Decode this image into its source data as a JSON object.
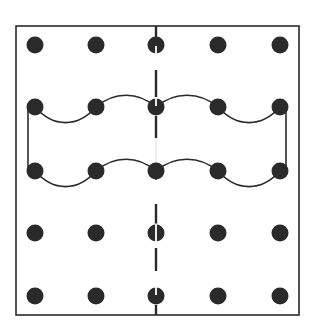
{
  "figure": {
    "width": 310,
    "height": 330,
    "background": "#ffffff",
    "ink_color": "#2a2a2a",
    "frame": {
      "x1": 16,
      "y1": 26,
      "x2": 299,
      "y2": 315,
      "stroke_width": 1.6
    },
    "grid": {
      "columns_x": [
        35,
        96,
        156,
        218,
        280
      ],
      "rows_y": [
        45,
        107,
        171,
        233,
        296
      ],
      "dot_radius": 8.5
    },
    "axis_of_symmetry": {
      "x": 156,
      "dashes": [
        [
          26,
          38
        ],
        [
          70,
          97
        ],
        [
          116,
          138
        ],
        [
          204,
          226
        ],
        [
          248,
          271
        ],
        [
          305,
          315
        ]
      ],
      "faint_segment": [
        138,
        163
      ],
      "pin_segments": [
        [
          163,
          180
        ]
      ],
      "slit_color": "#ffffff"
    },
    "wave_shape": {
      "upper_row_y": 107,
      "lower_row_y": 171,
      "trough_depth": 16,
      "crest_height": 12,
      "left_edge_x": 28,
      "right_edge_x": 286,
      "stroke_width": 1.6
    },
    "slit_dots": [
      {
        "col": 2,
        "row": 0,
        "slit": "bottom"
      },
      {
        "col": 2,
        "row": 1,
        "slit": "top"
      },
      {
        "col": 2,
        "row": 3,
        "slit": "full"
      },
      {
        "col": 2,
        "row": 4,
        "slit": "top"
      }
    ]
  }
}
